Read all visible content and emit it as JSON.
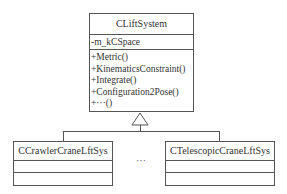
{
  "diagram": {
    "type": "UML class diagram",
    "parent_class": {
      "name": "CLiftSystem",
      "attributes": [
        "-m_kCSpace"
      ],
      "methods": [
        "+Metric()",
        "+KinematicsConstraint()",
        "+Integrate()",
        "+Configuration2Pose()",
        "+···()"
      ]
    },
    "child_classes": [
      {
        "name": "CCrawlerCraneLftSys"
      },
      {
        "name": "CTelescopicCraneLftSys"
      }
    ],
    "ellipsis": "···",
    "relation": "generalization"
  }
}
